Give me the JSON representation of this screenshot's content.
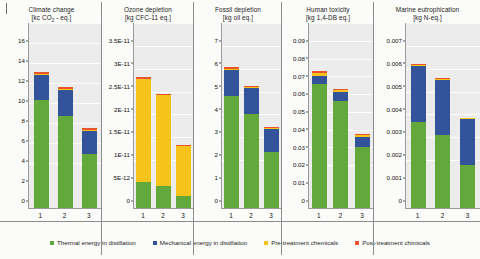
{
  "legend": {
    "position": "bottom",
    "items": [
      {
        "label": "Thermal energy in distillation",
        "color": "#63a83a",
        "key": "thermal"
      },
      {
        "label": "Mechanical energy in distillation",
        "color": "#33549b",
        "key": "mechanical"
      },
      {
        "label": "Pre-treatment chemicals",
        "color": "#f5c31a",
        "key": "pre"
      },
      {
        "label": "Post-treatment chimicals",
        "color": "#e8542e",
        "key": "post"
      }
    ]
  },
  "chart_data": [
    {
      "type": "bar",
      "stacked": true,
      "title": "Climate change",
      "unit": "[kc CO2 - eq.]",
      "unit_html": "[kc CO<sub>2</sub> - eq.]",
      "xlabel": "",
      "ylabel": "",
      "categories": [
        "1",
        "2",
        "3"
      ],
      "ylim": [
        0,
        16
      ],
      "yticks": [
        0,
        2,
        4,
        6,
        8,
        10,
        12,
        14,
        16
      ],
      "ytick_labels": [
        "0",
        "2",
        "4",
        "6",
        "8",
        "10",
        "12",
        "14",
        "16"
      ],
      "grid": true,
      "series": [
        {
          "name": "Thermal energy in distillation",
          "values": [
            10.8,
            9.2,
            5.4
          ]
        },
        {
          "name": "Mechanical energy in distillation",
          "values": [
            2.5,
            2.65,
            2.3
          ]
        },
        {
          "name": "Pre-treatment chemicals",
          "values": [
            0.07,
            0.06,
            0.04
          ]
        },
        {
          "name": "Post-treatment chimicals",
          "values": [
            0.25,
            0.22,
            0.24
          ]
        }
      ],
      "totals": [
        13.62,
        12.13,
        7.98
      ]
    },
    {
      "type": "bar",
      "stacked": true,
      "title": "Ozone depletion",
      "unit": "[kg CFC-11 eq.]",
      "unit_html": "[kg CFC-11 eq.]",
      "xlabel": "",
      "ylabel": "",
      "categories": [
        "1",
        "2",
        "3"
      ],
      "ylim": [
        0,
        3.5e-11
      ],
      "yticks": [
        0,
        5e-12,
        1e-11,
        1.5e-11,
        2e-11,
        2.5e-11,
        3e-11,
        3.5e-11
      ],
      "ytick_labels": [
        "0",
        "5E-12",
        "1E-11",
        "1.5E-11",
        "2E-11",
        "2.5E-11",
        "3E-11",
        "3.5E-11"
      ],
      "grid": true,
      "series": [
        {
          "name": "Thermal energy in distillation",
          "values": [
            5.6e-12,
            4.9e-12,
            2.6e-12
          ]
        },
        {
          "name": "Mechanical energy in distillation",
          "values": [
            0,
            0,
            0
          ]
        },
        {
          "name": "Pre-treatment chemicals",
          "values": [
            2.27e-11,
            1.99e-11,
            1.1e-11
          ]
        },
        {
          "name": "Post-treatment chimicals",
          "values": [
            3e-13,
            2.5e-13,
            2e-13
          ]
        }
      ],
      "totals": [
        2.86e-11,
        2.505e-11,
        1.38e-11
      ]
    },
    {
      "type": "bar",
      "stacked": true,
      "title": "Fossil depletion",
      "unit": "[kg oil eq.]",
      "unit_html": "[kg oil eq.]",
      "xlabel": "",
      "ylabel": "",
      "categories": [
        "1",
        "2",
        "3"
      ],
      "ylim": [
        0,
        7
      ],
      "yticks": [
        0,
        1,
        2,
        3,
        4,
        5,
        6,
        7
      ],
      "ytick_labels": [
        "0",
        "1",
        "2",
        "3",
        "4",
        "5",
        "6",
        "7"
      ],
      "grid": true,
      "series": [
        {
          "name": "Thermal energy in distillation",
          "values": [
            4.9,
            4.1,
            2.45
          ]
        },
        {
          "name": "Mechanical energy in distillation",
          "values": [
            1.15,
            1.15,
            1.0
          ]
        },
        {
          "name": "Pre-treatment chemicals",
          "values": [
            0.04,
            0.04,
            0.03
          ]
        },
        {
          "name": "Post-treatment chimicals",
          "values": [
            0.06,
            0.06,
            0.07
          ]
        }
      ],
      "totals": [
        6.15,
        5.35,
        3.55
      ]
    },
    {
      "type": "bar",
      "stacked": true,
      "title": "Human toxicity",
      "unit": "[kg 1,4-DB eq.]",
      "unit_html": "[kg 1,4-DB eq.]",
      "xlabel": "",
      "ylabel": "",
      "categories": [
        "1",
        "2",
        "3"
      ],
      "ylim": [
        0,
        0.09
      ],
      "yticks": [
        0,
        0.01,
        0.02,
        0.03,
        0.04,
        0.05,
        0.06,
        0.07,
        0.08,
        0.09
      ],
      "ytick_labels": [
        "0",
        "0.01",
        "0.02",
        "0.03",
        "0.04",
        "0.05",
        "0.06",
        "0.07",
        "0.08",
        "0.09"
      ],
      "grid": true,
      "series": [
        {
          "name": "Thermal energy in distillation",
          "values": [
            0.07,
            0.06,
            0.0345
          ]
        },
        {
          "name": "Mechanical energy in distillation",
          "values": [
            0.0045,
            0.005,
            0.0055
          ]
        },
        {
          "name": "Pre-treatment chemicals",
          "values": [
            0.0016,
            0.0014,
            0.0012
          ]
        },
        {
          "name": "Post-treatment chimicals",
          "values": [
            0.0007,
            0.0006,
            0.0006
          ]
        }
      ],
      "totals": [
        0.0768,
        0.067,
        0.0418
      ]
    },
    {
      "type": "bar",
      "stacked": true,
      "title": "Marine eutrophication",
      "unit": "[kg N-eq.]",
      "unit_html": "[kg N-eq.]",
      "xlabel": "",
      "ylabel": "",
      "categories": [
        "1",
        "2",
        "3"
      ],
      "ylim": [
        0,
        0.007
      ],
      "yticks": [
        0,
        0.001,
        0.002,
        0.003,
        0.004,
        0.005,
        0.006,
        0.007
      ],
      "ytick_labels": [
        "0",
        "0.001",
        "0.002",
        "0.003",
        "0.004",
        "0.005",
        "0.006",
        "0.007"
      ],
      "grid": true,
      "series": [
        {
          "name": "Thermal energy in distillation",
          "values": [
            0.00378,
            0.00318,
            0.0019
          ]
        },
        {
          "name": "Mechanical energy in distillation",
          "values": [
            0.00243,
            0.00243,
            0.00198
          ]
        },
        {
          "name": "Pre-treatment chemicals",
          "values": [
            5e-05,
            5e-05,
            4e-05
          ]
        },
        {
          "name": "Post-treatment chimicals",
          "values": [
            4e-05,
            4e-05,
            3e-05
          ]
        }
      ],
      "totals": [
        0.0063,
        0.0057,
        0.00395
      ]
    }
  ]
}
